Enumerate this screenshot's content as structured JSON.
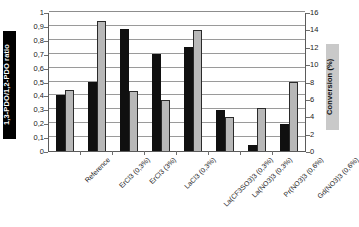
{
  "chart_data": {
    "type": "bar",
    "title": "",
    "xlabel": "",
    "ylabel": "1,3-PDO/1,2-PDO ratio",
    "ylabel_right": "Conversion (%)",
    "grid": true,
    "legend": "none",
    "ylim": [
      0,
      1
    ],
    "ylim_right": [
      0,
      16
    ],
    "yticks": [
      "0",
      "0,1",
      "0,2",
      "0,3",
      "0,4",
      "0,5",
      "0,6",
      "0,7",
      "0,8",
      "0,9",
      "1"
    ],
    "yticks_right": [
      "0",
      "2",
      "4",
      "6",
      "8",
      "10",
      "12",
      "14",
      "16"
    ],
    "categories": [
      "Reference",
      "ErCl3 (0,3%)",
      "ErCl3 (3%)",
      "LaCl3 (0,3%)",
      "La(CF3SO3)3 (0,3%)",
      "La(NO3)3 (0,3%)",
      "Pr(NO3)3 (0,6%)",
      "Gd(NO3)3 (0,6%)"
    ],
    "series": [
      {
        "name": "1,3-PDO/1,2-PDO ratio",
        "axis": "left",
        "color": "#101010",
        "values": [
          0.4,
          0.5,
          0.88,
          0.7,
          0.745,
          0.295,
          0.045,
          0.195
        ]
      },
      {
        "name": "Conversion (%)",
        "axis": "right",
        "color": "#b8b8b8",
        "values": [
          7.0,
          15.0,
          6.9,
          5.85,
          13.9,
          3.9,
          4.9,
          7.9
        ]
      }
    ]
  },
  "colors": {
    "ratio_bar": "#101010",
    "conversion_bar": "#b8b8b8",
    "left_label_bg": "#000000",
    "left_label_text": "#ffffff",
    "right_label_bg": "#c9c9c9",
    "right_label_text": "#111111",
    "gridline": "#9a9a9a",
    "axis": "#5b5b5b"
  }
}
